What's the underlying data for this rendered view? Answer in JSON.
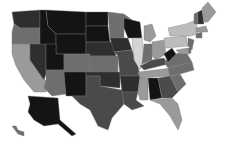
{
  "map": {
    "title": "",
    "type": "choropleth",
    "region": "United States",
    "palette": {
      "very_dark": "#141414",
      "dark": "#2e2e2e",
      "mid_dark": "#4a4a4a",
      "mid": "#6e6e6e",
      "light": "#9a9a9a",
      "lighter": "#bdbdbd",
      "lightest": "#d4d4d4"
    },
    "states": [
      {
        "id": "WA",
        "shade": "dark"
      },
      {
        "id": "OR",
        "shade": "mid"
      },
      {
        "id": "CA",
        "shade": "light"
      },
      {
        "id": "ID",
        "shade": "very_dark"
      },
      {
        "id": "NV",
        "shade": "dark"
      },
      {
        "id": "MT",
        "shade": "very_dark"
      },
      {
        "id": "WY",
        "shade": "very_dark"
      },
      {
        "id": "UT",
        "shade": "very_dark"
      },
      {
        "id": "AZ",
        "shade": "mid"
      },
      {
        "id": "CO",
        "shade": "mid"
      },
      {
        "id": "NM",
        "shade": "very_dark"
      },
      {
        "id": "ND",
        "shade": "very_dark"
      },
      {
        "id": "SD",
        "shade": "very_dark"
      },
      {
        "id": "NE",
        "shade": "dark"
      },
      {
        "id": "KS",
        "shade": "mid"
      },
      {
        "id": "OK",
        "shade": "dark"
      },
      {
        "id": "TX",
        "shade": "mid_dark"
      },
      {
        "id": "MN",
        "shade": "mid"
      },
      {
        "id": "IA",
        "shade": "dark"
      },
      {
        "id": "MO",
        "shade": "mid_dark"
      },
      {
        "id": "AR",
        "shade": "dark"
      },
      {
        "id": "LA",
        "shade": "mid_dark"
      },
      {
        "id": "WI",
        "shade": "very_dark"
      },
      {
        "id": "IL",
        "shade": "lightest"
      },
      {
        "id": "MI",
        "shade": "light"
      },
      {
        "id": "IN",
        "shade": "mid"
      },
      {
        "id": "OH",
        "shade": "light"
      },
      {
        "id": "KY",
        "shade": "mid_dark"
      },
      {
        "id": "TN",
        "shade": "light"
      },
      {
        "id": "MS",
        "shade": "light"
      },
      {
        "id": "AL",
        "shade": "very_dark"
      },
      {
        "id": "GA",
        "shade": "mid_dark"
      },
      {
        "id": "FL",
        "shade": "light"
      },
      {
        "id": "SC",
        "shade": "mid"
      },
      {
        "id": "NC",
        "shade": "mid"
      },
      {
        "id": "VA",
        "shade": "mid"
      },
      {
        "id": "WV",
        "shade": "very_dark"
      },
      {
        "id": "PA",
        "shade": "lighter"
      },
      {
        "id": "NY",
        "shade": "lighter"
      },
      {
        "id": "VT",
        "shade": "mid"
      },
      {
        "id": "NH",
        "shade": "dark"
      },
      {
        "id": "ME",
        "shade": "light"
      },
      {
        "id": "MA",
        "shade": "light"
      },
      {
        "id": "CT",
        "shade": "mid"
      },
      {
        "id": "NJ",
        "shade": "mid"
      },
      {
        "id": "MD",
        "shade": "light"
      },
      {
        "id": "DE",
        "shade": "mid"
      },
      {
        "id": "AK",
        "shade": "very_dark"
      },
      {
        "id": "HI",
        "shade": "mid"
      }
    ]
  }
}
